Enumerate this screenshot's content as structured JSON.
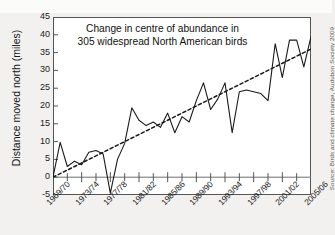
{
  "figure": {
    "top_cut_text": "",
    "callout_line1": "Change in centre of abundance in",
    "callout_line2": "305 widespread North American birds",
    "source_note": "Source: Birds and climate change, Audubon Society 2009",
    "colors": {
      "background": "#f2f1ef",
      "plot_background": "#ffffff",
      "series_line": "#1a1a1a",
      "trend_line": "#1a1a1a",
      "axis": "#555555",
      "text": "#17171a"
    }
  },
  "chart_data": {
    "type": "line",
    "title": "Change in centre of abundance in 305 widespread North American birds",
    "xlabel": "",
    "ylabel": "Distance moved north  (miles)",
    "ylim": [
      -5,
      45
    ],
    "yticks": [
      -5,
      0,
      5,
      10,
      15,
      20,
      25,
      30,
      35,
      40,
      45
    ],
    "ytick_labels": [
      "-5",
      "0",
      "5",
      "10",
      "15",
      "20",
      "25",
      "30",
      "35",
      "40",
      "45"
    ],
    "xlim": [
      1969,
      2005
    ],
    "xticks": [
      1969,
      1973,
      1977,
      1981,
      1985,
      1989,
      1993,
      1997,
      2001,
      2005
    ],
    "xtick_labels": [
      "1969/70",
      "1973/74",
      "1977/78",
      "1981/82",
      "1985/86",
      "1989/90",
      "1993/94",
      "1997/98",
      "2001/02",
      "2005/06"
    ],
    "grid": false,
    "legend": "none",
    "x": [
      1969,
      1970,
      1971,
      1972,
      1973,
      1974,
      1975,
      1976,
      1977,
      1978,
      1979,
      1980,
      1981,
      1982,
      1983,
      1984,
      1985,
      1986,
      1987,
      1988,
      1989,
      1990,
      1991,
      1992,
      1993,
      1994,
      1995,
      1996,
      1997,
      1998,
      1999,
      2000,
      2001,
      2002,
      2003,
      2004,
      2005
    ],
    "series": [
      {
        "name": "Centre of abundance shift",
        "style": "solid",
        "values": [
          0.0,
          9.8,
          3.0,
          4.5,
          3.5,
          7.0,
          7.5,
          6.5,
          -4.5,
          5.0,
          9.5,
          19.5,
          16.0,
          14.5,
          15.5,
          14.0,
          18.0,
          12.5,
          17.0,
          15.5,
          21.5,
          26.5,
          19.0,
          22.0,
          26.5,
          12.5,
          24.0,
          24.5,
          24.0,
          23.5,
          21.5,
          37.5,
          28.0,
          38.5,
          38.5,
          31.0,
          39.5
        ]
      },
      {
        "name": "Linear trend",
        "style": "dashed",
        "values": [
          0.0,
          1.0,
          2.0,
          3.0,
          4.0,
          5.0,
          6.0,
          7.0,
          8.0,
          9.0,
          10.0,
          11.0,
          12.0,
          13.0,
          14.0,
          15.0,
          16.0,
          17.0,
          18.0,
          19.0,
          20.0,
          21.0,
          22.0,
          23.0,
          24.0,
          25.0,
          26.0,
          27.0,
          28.0,
          29.0,
          30.0,
          31.0,
          32.0,
          33.0,
          34.0,
          35.0,
          36.0
        ],
        "endpoints": [
          0.0,
          36.0
        ]
      }
    ]
  }
}
